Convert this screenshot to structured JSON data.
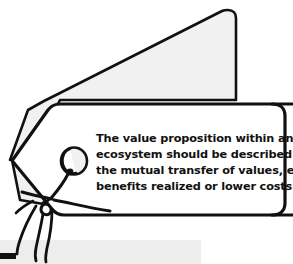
{
  "illustration": {
    "title": "hand-drawn tag illustration",
    "style": "sketch",
    "colors": {
      "background": "#ffffff",
      "ink": "#111111",
      "tag_fill": "#ffffff",
      "shadow_tag_fill": "#f1f1f1",
      "bottom_band_fill": "#ededed",
      "eyelet_fill": "#f1f1f1"
    }
  },
  "tag": {
    "label": "value-proposition-tag",
    "text_lines": [
      "The value proposition within an",
      "ecosystem should be described as",
      "the mutual transfer of values, e.g.",
      "benefits realized or lower costs."
    ],
    "full_text": "The value proposition within an ecosystem should be described as the mutual transfer of values, e.g. benefits realized or lower costs."
  },
  "decor": {
    "shadow_tag_label": "background tag shadow",
    "string_label": "tag string",
    "eyelet_label": "tag eyelet hole",
    "bottom_band_label": "bottom gray band",
    "corner_mark_label": "bottom-left black mark"
  }
}
